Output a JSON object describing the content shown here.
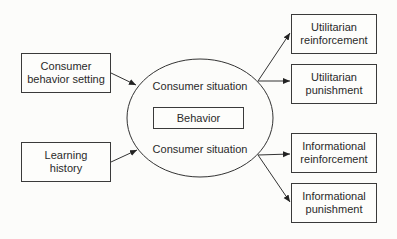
{
  "diagram": {
    "inputs": [
      {
        "id": "consumer-behavior-setting",
        "label": "Consumer\nbehavior setting"
      },
      {
        "id": "learning-history",
        "label": "Learning\nhistory"
      }
    ],
    "center": {
      "top_label": "Consumer situation",
      "inner_box": "Behavior",
      "bottom_label": "Consumer situation"
    },
    "outputs": [
      {
        "id": "utilitarian-reinforcement",
        "label": "Utilitarian\nreinforcement"
      },
      {
        "id": "utilitarian-punishment",
        "label": "Utilitarian\npunishment"
      },
      {
        "id": "informational-reinforcement",
        "label": "Informational\nreinforcement"
      },
      {
        "id": "informational-punishment",
        "label": "Informational\npunishment"
      }
    ],
    "edges": [
      {
        "from": "consumer-behavior-setting",
        "to": "consumer-situation"
      },
      {
        "from": "learning-history",
        "to": "consumer-situation"
      },
      {
        "from": "consumer-situation",
        "to": "utilitarian-reinforcement"
      },
      {
        "from": "consumer-situation",
        "to": "utilitarian-punishment"
      },
      {
        "from": "consumer-situation",
        "to": "informational-reinforcement"
      },
      {
        "from": "consumer-situation",
        "to": "informational-punishment"
      }
    ]
  }
}
